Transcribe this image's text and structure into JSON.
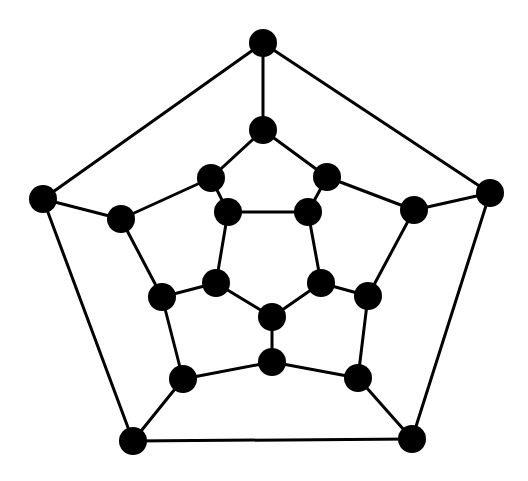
{
  "diagram": {
    "title": "",
    "type": "graph",
    "colors": {
      "node": "#000000",
      "edge": "#000000",
      "background": "#ffffff"
    },
    "node_radius": 14,
    "nodes": [
      {
        "id": "o1",
        "x": 263,
        "y": 43
      },
      {
        "id": "o2",
        "x": 490,
        "y": 193
      },
      {
        "id": "o3",
        "x": 412,
        "y": 439
      },
      {
        "id": "o4",
        "x": 133,
        "y": 441
      },
      {
        "id": "o5",
        "x": 43,
        "y": 199
      },
      {
        "id": "m1",
        "x": 263,
        "y": 130
      },
      {
        "id": "m2",
        "x": 327,
        "y": 177
      },
      {
        "id": "m3",
        "x": 414,
        "y": 210
      },
      {
        "id": "m4",
        "x": 368,
        "y": 296
      },
      {
        "id": "m5",
        "x": 358,
        "y": 378
      },
      {
        "id": "m6",
        "x": 272,
        "y": 362
      },
      {
        "id": "m7",
        "x": 183,
        "y": 379
      },
      {
        "id": "m8",
        "x": 162,
        "y": 297
      },
      {
        "id": "m9",
        "x": 121,
        "y": 219
      },
      {
        "id": "m10",
        "x": 211,
        "y": 178
      },
      {
        "id": "i1",
        "x": 228,
        "y": 212
      },
      {
        "id": "i2",
        "x": 308,
        "y": 212
      },
      {
        "id": "i3",
        "x": 321,
        "y": 283
      },
      {
        "id": "i4",
        "x": 272,
        "y": 317
      },
      {
        "id": "i5",
        "x": 216,
        "y": 283
      }
    ],
    "edges": [
      [
        "o1",
        "o2"
      ],
      [
        "o2",
        "o3"
      ],
      [
        "o3",
        "o4"
      ],
      [
        "o4",
        "o5"
      ],
      [
        "o5",
        "o1"
      ],
      [
        "o1",
        "m1"
      ],
      [
        "o2",
        "m3"
      ],
      [
        "o3",
        "m5"
      ],
      [
        "o4",
        "m7"
      ],
      [
        "o5",
        "m9"
      ],
      [
        "m1",
        "m2"
      ],
      [
        "m2",
        "m3"
      ],
      [
        "m3",
        "m4"
      ],
      [
        "m4",
        "m5"
      ],
      [
        "m5",
        "m6"
      ],
      [
        "m6",
        "m7"
      ],
      [
        "m7",
        "m8"
      ],
      [
        "m8",
        "m9"
      ],
      [
        "m9",
        "m10"
      ],
      [
        "m10",
        "m1"
      ],
      [
        "m10",
        "i1"
      ],
      [
        "m2",
        "i2"
      ],
      [
        "m4",
        "i3"
      ],
      [
        "m6",
        "i4"
      ],
      [
        "m8",
        "i5"
      ],
      [
        "i1",
        "i2"
      ],
      [
        "i2",
        "i3"
      ],
      [
        "i3",
        "i4"
      ],
      [
        "i4",
        "i5"
      ],
      [
        "i5",
        "i1"
      ]
    ]
  }
}
